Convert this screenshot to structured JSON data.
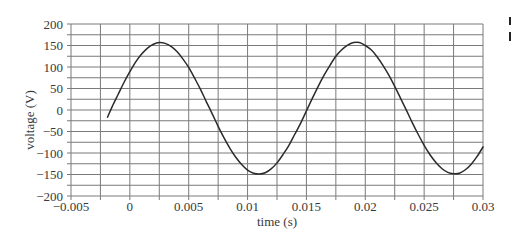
{
  "chart_data": {
    "type": "line",
    "title": "",
    "xlabel": "time (s)",
    "ylabel": "voltage (V)",
    "xlim": [
      -0.005,
      0.03
    ],
    "ylim": [
      -200,
      200
    ],
    "grid": true,
    "legend": null,
    "x_grid_step": 0.0025,
    "y_grid_step": 25,
    "x_ticks": [
      -0.005,
      0,
      0.005,
      0.01,
      0.015,
      0.02,
      0.025,
      0.03
    ],
    "x_tick_labels": [
      "−0.005",
      "0",
      "0.005",
      "0.01",
      "0.015",
      "0.02",
      "0.025",
      "0.03"
    ],
    "y_ticks": [
      200,
      150,
      100,
      50,
      0,
      -50,
      -100,
      -150,
      -200
    ],
    "y_tick_labels": [
      "200",
      "150",
      "100",
      "50",
      "0",
      "−50",
      "−100",
      "−150",
      "−200"
    ],
    "colors": {
      "line": "#2b2b2b",
      "grid": "#7a7a7a",
      "text": "#3a3a3a"
    },
    "series": [
      {
        "name": "voltage",
        "x": [
          -0.0019,
          -0.0015,
          -0.001,
          -0.0005,
          0,
          0.0005,
          0.001,
          0.0015,
          0.002,
          0.0025,
          0.003,
          0.0035,
          0.004,
          0.0045,
          0.005,
          0.0055,
          0.006,
          0.0065,
          0.007,
          0.0075,
          0.008,
          0.0085,
          0.009,
          0.0095,
          0.01,
          0.0105,
          0.011,
          0.0115,
          0.012,
          0.0125,
          0.013,
          0.0135,
          0.014,
          0.0145,
          0.015,
          0.0155,
          0.016,
          0.0165,
          0.017,
          0.0175,
          0.018,
          0.0185,
          0.019,
          0.0195,
          0.02,
          0.0205,
          0.021,
          0.0215,
          0.022,
          0.0225,
          0.023,
          0.0235,
          0.024,
          0.0245,
          0.025,
          0.0255,
          0.026,
          0.0265,
          0.027,
          0.0275,
          0.028,
          0.0285,
          0.029,
          0.0295,
          0.03
        ],
        "y": [
          -17,
          8,
          36,
          64,
          89,
          112,
          130,
          144,
          153,
          157,
          155,
          148,
          136,
          119,
          99,
          74,
          48,
          19,
          -9,
          -38,
          -65,
          -89,
          -110,
          -127,
          -140,
          -147,
          -149,
          -146,
          -137,
          -123,
          -104,
          -83,
          -57,
          -31,
          -2,
          27,
          55,
          81,
          104,
          125,
          140,
          151,
          157,
          157,
          150,
          140,
          124,
          104,
          81,
          55,
          27,
          -1,
          -30,
          -57,
          -82,
          -104,
          -122,
          -136,
          -145,
          -148,
          -147,
          -139,
          -126,
          -108,
          -86
        ]
      }
    ]
  }
}
